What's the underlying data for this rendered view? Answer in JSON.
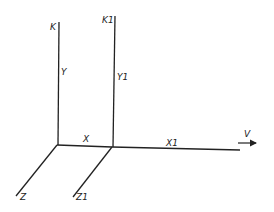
{
  "diagram": {
    "type": "coordinate-frames",
    "line_color": "#222222",
    "frame_1": {
      "vertical_top_label": "K",
      "vertical_axis_label": "Y",
      "horizontal_axis_label": "X",
      "depth_axis_label": "Z"
    },
    "frame_2": {
      "vertical_top_label": "K1",
      "vertical_axis_label": "Y1",
      "horizontal_axis_label": "X1",
      "depth_axis_label": "Z1"
    },
    "velocity": {
      "label": "V",
      "direction": "right"
    }
  }
}
